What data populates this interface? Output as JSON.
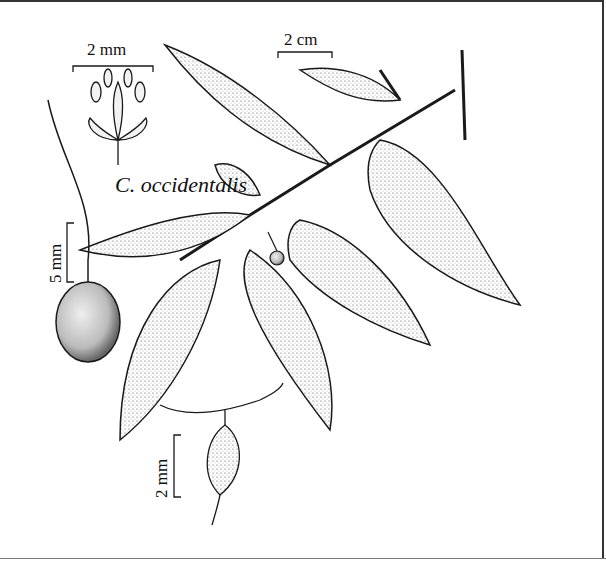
{
  "figure": {
    "species_label": "C. occidentalis",
    "scale_bars": {
      "flower": "2 mm",
      "branch": "2 cm",
      "fruit": "5 mm",
      "pistillate_flower": "2 mm"
    }
  },
  "colors": {
    "ink": "#1a1a1a",
    "paper": "#ffffff",
    "fruit_fill": "#cfcfcf",
    "leaf_shade": "#e6e6e6"
  }
}
